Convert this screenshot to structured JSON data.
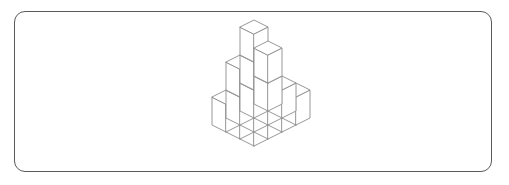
{
  "figure": {
    "title": "Isometric unit-cube stack",
    "background_color": "#ffffff",
    "frame": {
      "shape": "rounded-rectangle",
      "stroke_color": "#5a5a5a",
      "stroke_width": 1,
      "corner_radius": 11,
      "x": 14,
      "y": 11,
      "width": 478,
      "height": 161
    },
    "line_color": "#8c8c8c",
    "face_fill": "#ffffff",
    "projection": {
      "type": "isometric",
      "cube_half_width": 14,
      "cube_rise": 7,
      "cube_height": 28,
      "origin_x": 254,
      "origin_y": 146
    },
    "cube_count": 16,
    "grid": {
      "columns": 4,
      "rows": 3,
      "max_height": 3
    },
    "cubes": [
      {
        "x": 0,
        "y": 0,
        "z": 0
      },
      {
        "x": 1,
        "y": 0,
        "z": 0
      },
      {
        "x": 2,
        "y": 0,
        "z": 0
      },
      {
        "x": 3,
        "y": 0,
        "z": 0
      },
      {
        "x": 0,
        "y": 1,
        "z": 0
      },
      {
        "x": 1,
        "y": 1,
        "z": 0
      },
      {
        "x": 2,
        "y": 1,
        "z": 0
      },
      {
        "x": 3,
        "y": 1,
        "z": 0
      },
      {
        "x": 0,
        "y": 2,
        "z": 0
      },
      {
        "x": 1,
        "y": 2,
        "z": 0
      },
      {
        "x": 2,
        "y": 2,
        "z": 0
      },
      {
        "x": 3,
        "y": 2,
        "z": 0
      },
      {
        "x": 1,
        "y": 2,
        "z": 1
      },
      {
        "x": 2,
        "y": 2,
        "z": 1
      },
      {
        "x": 3,
        "y": 2,
        "z": 1
      },
      {
        "x": 2,
        "y": 2,
        "z": 2
      }
    ]
  }
}
